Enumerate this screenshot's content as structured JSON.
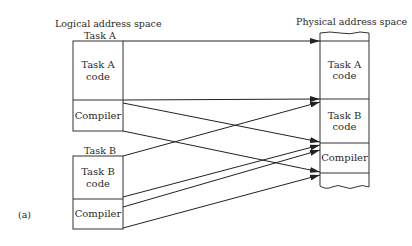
{
  "diagram": {
    "caption": "(a)",
    "logical": {
      "heading": "Logical address space",
      "taskA": {
        "title": "Task A",
        "code": "Task A\ncode",
        "compiler": "Compiler"
      },
      "taskB": {
        "title": "Task B",
        "code": "Task B\ncode",
        "compiler": "Compiler"
      }
    },
    "physical": {
      "heading": "Physical address space",
      "segments": [
        {
          "label": "Task A\ncode"
        },
        {
          "label": "Task B\ncode"
        },
        {
          "label": "Compiler"
        }
      ]
    },
    "mappings": [
      {
        "from": "Task A code (top)",
        "to": "Task A code (top)"
      },
      {
        "from": "Task A code (bottom)",
        "to": "Task A code (bottom)"
      },
      {
        "from": "Task A compiler (top)",
        "to": "Compiler (top)"
      },
      {
        "from": "Task A compiler (bottom)",
        "to": "Compiler (bottom)"
      },
      {
        "from": "Task B code (top)",
        "to": "Task B code (top)"
      },
      {
        "from": "Task B code (bottom)",
        "to": "Task B code (bottom)"
      },
      {
        "from": "Task B compiler (top)",
        "to": "Compiler (top)"
      },
      {
        "from": "Task B compiler (bottom)",
        "to": "Compiler (bottom)"
      }
    ]
  }
}
